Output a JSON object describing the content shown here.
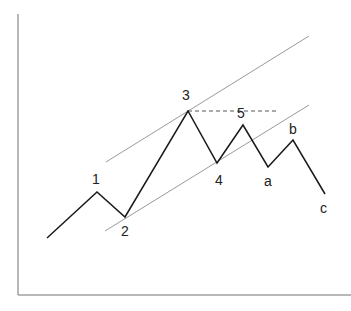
{
  "diagram": {
    "wave_points": [
      {
        "id": "start",
        "label": ""
      },
      {
        "id": "w1",
        "label": "1"
      },
      {
        "id": "w2",
        "label": "2"
      },
      {
        "id": "w3",
        "label": "3"
      },
      {
        "id": "w4",
        "label": "4"
      },
      {
        "id": "w5",
        "label": "5"
      },
      {
        "id": "wa",
        "label": "a"
      },
      {
        "id": "wb",
        "label": "b"
      },
      {
        "id": "wc",
        "label": "c"
      }
    ],
    "colors": {
      "wave": "#1a1a1a",
      "channel": "#9a9a9a",
      "axis": "#a0a0a0",
      "dashed": "#555555",
      "label": "#222222"
    }
  }
}
